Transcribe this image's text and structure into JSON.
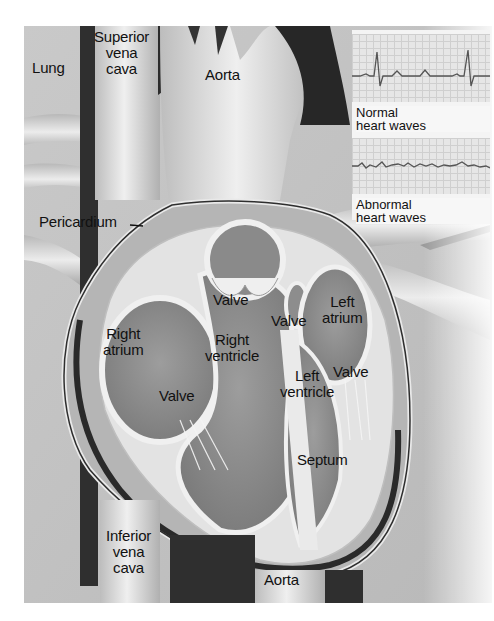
{
  "figure": {
    "labels": {
      "lung": "Lung",
      "superior_vena_cava": "Superior\nvena\ncava",
      "aorta_top": "Aorta",
      "pericardium": "Pericardium",
      "right_atrium": "Right\natrium",
      "valve_pulmonary": "Valve",
      "right_ventricle": "Right\nventricle",
      "valve_aortic": "Valve",
      "left_atrium": "Left\natrium",
      "valve_tricuspid": "Valve",
      "left_ventricle": "Left\nventricle",
      "valve_mitral": "Valve",
      "septum": "Septum",
      "inferior_vena_cava": "Inferior\nvena\ncava",
      "aorta_bottom": "Aorta"
    },
    "inset": {
      "normal_caption": "Normal\nheart waves",
      "abnormal_caption": "Abnormal\nheart waves"
    },
    "colors": {
      "background": "#ffffff",
      "tissue_light": "#d8d8d8",
      "tissue_mid": "#a8a8a8",
      "tissue_dark": "#3a3a3a",
      "chamber": "#8e8e8e",
      "wall": "#e8e8e8",
      "ekg_trace": "#555555"
    }
  }
}
